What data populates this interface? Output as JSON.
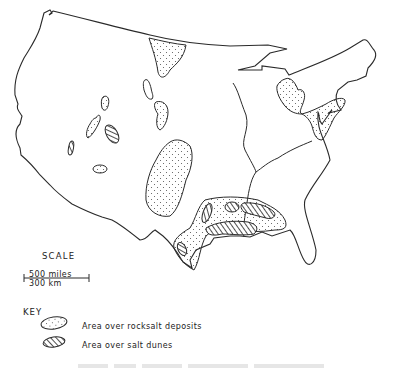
{
  "map": {
    "subject": "United States outline with rocksalt deposits and salt dunes",
    "colors": {
      "line": "#2a2a2a",
      "background": "#ffffff",
      "stipple": "#555555"
    },
    "features": {
      "rocksalt_areas": [
        "Montana/Dakota",
        "Idaho",
        "Utah",
        "Colorado",
        "Kansas/Oklahoma/Texas",
        "Michigan",
        "Ohio/Pennsylvania/New York",
        "Gulf Coast"
      ],
      "salt_dune_areas": [
        "Nevada",
        "Utah",
        "Gulf Coast Louisiana",
        "Gulf Coast Texas",
        "Mississippi/Alabama"
      ]
    }
  },
  "scale": {
    "title": "SCALE",
    "top_label": "500 miles",
    "bottom_label": "300 km"
  },
  "key": {
    "title": "KEY",
    "items": [
      {
        "symbol": "stippled-ellipse-icon",
        "label": "Area over  rocksalt deposits"
      },
      {
        "symbol": "hatched-ellipse-icon",
        "label": "Area over salt dunes"
      }
    ]
  },
  "caption": {
    "visible": "partially clipped, illegible"
  }
}
